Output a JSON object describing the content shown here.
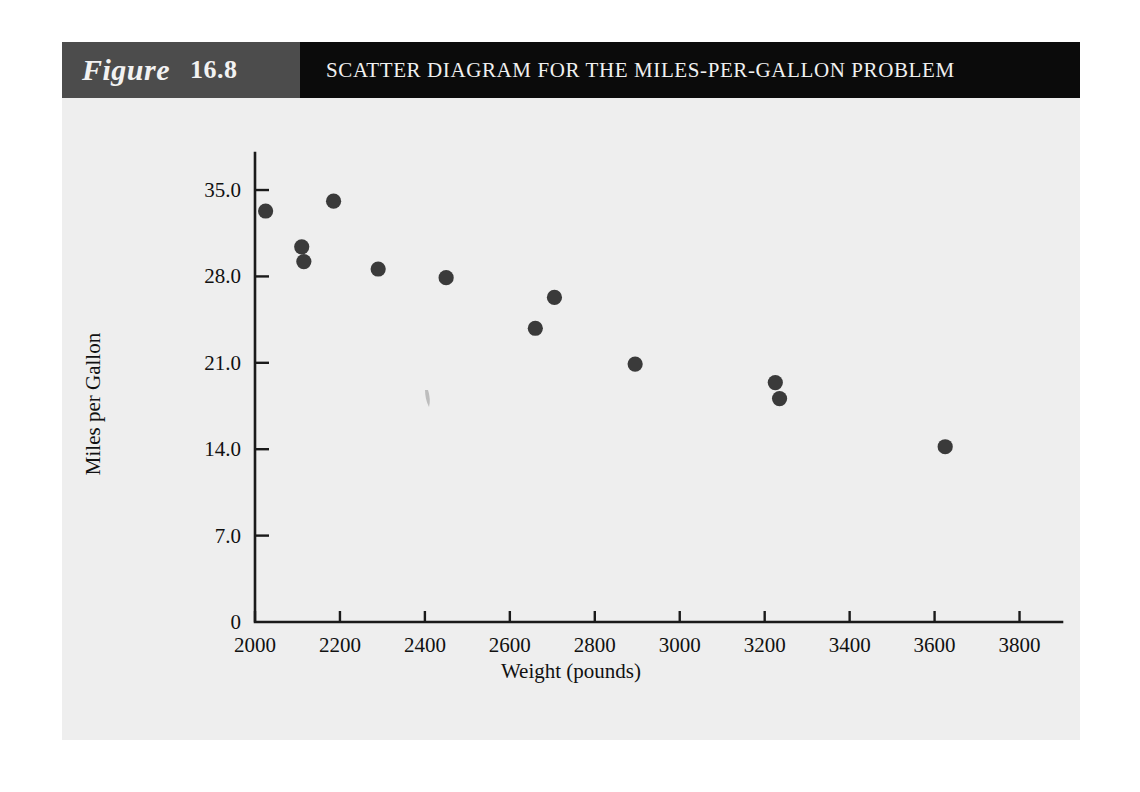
{
  "header": {
    "figure_word": "Figure",
    "figure_number": "16.8",
    "title": "SCATTER DIAGRAM FOR THE MILES-PER-GALLON PROBLEM",
    "figure_block_color": "#4c4c4c",
    "title_block_color": "#0b0b0b",
    "text_color": "#f0f0f0"
  },
  "panel": {
    "background_color": "#eeeeee",
    "axis_color": "#1a1a1a",
    "point_color": "#3a3a3a"
  },
  "chart_data": {
    "type": "scatter",
    "title": "SCATTER DIAGRAM FOR THE MILES-PER-GALLON PROBLEM",
    "xlabel": "Weight (pounds)",
    "ylabel": "Miles per Gallon",
    "xlim": [
      2000,
      3900
    ],
    "ylim": [
      0,
      38
    ],
    "xticks": [
      2000,
      2200,
      2400,
      2600,
      2800,
      3000,
      3200,
      3400,
      3600,
      3800
    ],
    "xticklabels": [
      "2000",
      "2200",
      "2400",
      "2600",
      "2800",
      "3000",
      "3200",
      "3400",
      "3600",
      "3800"
    ],
    "yticks": [
      0,
      7.0,
      14.0,
      21.0,
      28.0,
      35.0
    ],
    "yticklabels": [
      "0",
      "7.0",
      "14.0",
      "21.0",
      "28.0",
      "35.0"
    ],
    "grid": false,
    "legend": null,
    "marker": "circle",
    "x": [
      2025,
      2110,
      2115,
      2185,
      2290,
      2450,
      2660,
      2705,
      2895,
      3225,
      3235,
      3625
    ],
    "y": [
      33.3,
      30.4,
      29.2,
      34.1,
      28.6,
      27.9,
      23.8,
      26.3,
      20.9,
      19.4,
      18.1,
      14.2
    ],
    "points": [
      {
        "weight": 2025,
        "mpg": 33.3
      },
      {
        "weight": 2110,
        "mpg": 30.4
      },
      {
        "weight": 2115,
        "mpg": 29.2
      },
      {
        "weight": 2185,
        "mpg": 34.1
      },
      {
        "weight": 2290,
        "mpg": 28.6
      },
      {
        "weight": 2450,
        "mpg": 27.9
      },
      {
        "weight": 2660,
        "mpg": 23.8
      },
      {
        "weight": 2705,
        "mpg": 26.3
      },
      {
        "weight": 2895,
        "mpg": 20.9
      },
      {
        "weight": 3225,
        "mpg": 19.4
      },
      {
        "weight": 3235,
        "mpg": 18.1
      },
      {
        "weight": 3625,
        "mpg": 14.2
      }
    ]
  }
}
